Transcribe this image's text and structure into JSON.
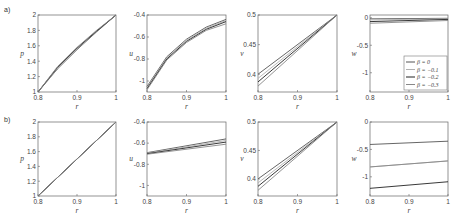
{
  "figure": {
    "row_labels": [
      "a)",
      "b)"
    ],
    "legend": {
      "entries": [
        "β = 0",
        "β = −0.1",
        "β = −0.2",
        "β = −0.3"
      ],
      "colors": [
        "#555555",
        "#b0b0b0",
        "#222222",
        "#888888"
      ],
      "position": "lower right of row a, panel w"
    }
  },
  "chart_data": [
    {
      "type": "line",
      "row": "a",
      "panel": 1,
      "xlabel": "r",
      "ylabel": "p",
      "xlim": [
        0.8,
        1
      ],
      "ylim": [
        1,
        2
      ],
      "xticks": [
        "0.8",
        "0.9",
        "1"
      ],
      "yticks": [
        "1",
        "1.2",
        "1.4",
        "1.6",
        "1.8",
        "2"
      ],
      "x": [
        0.8,
        0.85,
        0.9,
        0.95,
        1.0
      ],
      "series": [
        {
          "name": "β = 0",
          "values": [
            1.0,
            1.3,
            1.55,
            1.78,
            2.0
          ]
        },
        {
          "name": "β = −0.1",
          "values": [
            1.0,
            1.31,
            1.56,
            1.79,
            2.0
          ]
        },
        {
          "name": "β = −0.2",
          "values": [
            1.0,
            1.32,
            1.57,
            1.79,
            2.0
          ]
        },
        {
          "name": "β = −0.3",
          "values": [
            1.0,
            1.33,
            1.58,
            1.8,
            2.0
          ]
        }
      ]
    },
    {
      "type": "line",
      "row": "a",
      "panel": 2,
      "xlabel": "r",
      "ylabel": "u",
      "xlim": [
        0.8,
        1
      ],
      "ylim": [
        -1.1,
        -0.4
      ],
      "xticks": [
        "0.8",
        "0.9",
        "1"
      ],
      "yticks": [
        "-1",
        "-0.8",
        "-0.6",
        "-0.4"
      ],
      "x": [
        0.8,
        0.85,
        0.9,
        0.95,
        1.0
      ],
      "series": [
        {
          "name": "β = 0",
          "values": [
            -1.05,
            -0.78,
            -0.62,
            -0.51,
            -0.44
          ]
        },
        {
          "name": "β = −0.1",
          "values": [
            -1.06,
            -0.79,
            -0.63,
            -0.52,
            -0.45
          ]
        },
        {
          "name": "β = −0.2",
          "values": [
            -1.07,
            -0.8,
            -0.64,
            -0.53,
            -0.46
          ]
        },
        {
          "name": "β = −0.3",
          "values": [
            -1.08,
            -0.81,
            -0.65,
            -0.54,
            -0.48
          ]
        }
      ]
    },
    {
      "type": "line",
      "row": "a",
      "panel": 3,
      "xlabel": "r",
      "ylabel": "v",
      "xlim": [
        0.8,
        1
      ],
      "ylim": [
        0.37,
        0.5
      ],
      "xticks": [
        "0.8",
        "0.9",
        "1"
      ],
      "yticks": [
        "0.4",
        "0.45",
        "0.5"
      ],
      "x": [
        0.8,
        1.0
      ],
      "series": [
        {
          "name": "β = 0",
          "values": [
            0.4,
            0.5
          ]
        },
        {
          "name": "β = −0.1",
          "values": [
            0.393,
            0.5
          ]
        },
        {
          "name": "β = −0.2",
          "values": [
            0.387,
            0.5
          ]
        },
        {
          "name": "β = −0.3",
          "values": [
            0.38,
            0.5
          ]
        }
      ]
    },
    {
      "type": "line",
      "row": "a",
      "panel": 4,
      "xlabel": "r",
      "ylabel": "w",
      "xlim": [
        0.8,
        1
      ],
      "ylim": [
        -1.35,
        0.05
      ],
      "xticks": [
        "0.8",
        "0.9",
        "1"
      ],
      "yticks": [
        "-1",
        "-0.5",
        "0"
      ],
      "x": [
        0.8,
        1.0
      ],
      "series": [
        {
          "name": "β = 0",
          "values": [
            -0.02,
            -0.01
          ]
        },
        {
          "name": "β = −0.1",
          "values": [
            -0.04,
            -0.02
          ]
        },
        {
          "name": "β = −0.2",
          "values": [
            -0.07,
            -0.03
          ]
        },
        {
          "name": "β = −0.3",
          "values": [
            -0.1,
            -0.05
          ]
        }
      ],
      "legend": true
    },
    {
      "type": "line",
      "row": "b",
      "panel": 1,
      "xlabel": "r",
      "ylabel": "p",
      "xlim": [
        0.8,
        1
      ],
      "ylim": [
        1,
        2
      ],
      "xticks": [
        "0.8",
        "0.9",
        "1"
      ],
      "yticks": [
        "1",
        "1.2",
        "1.4",
        "1.6",
        "1.8",
        "2"
      ],
      "x": [
        0.8,
        1.0
      ],
      "series": [
        {
          "name": "β = 0",
          "values": [
            1.0,
            2.0
          ]
        },
        {
          "name": "β = −0.1",
          "values": [
            1.0,
            2.0
          ]
        },
        {
          "name": "β = −0.2",
          "values": [
            1.0,
            2.0
          ]
        },
        {
          "name": "β = −0.3",
          "values": [
            1.0,
            2.0
          ]
        }
      ]
    },
    {
      "type": "line",
      "row": "b",
      "panel": 2,
      "xlabel": "r",
      "ylabel": "u",
      "xlim": [
        0.8,
        1
      ],
      "ylim": [
        -1.1,
        -0.4
      ],
      "xticks": [
        "0.8",
        "0.9",
        "1"
      ],
      "yticks": [
        "-1",
        "-0.8",
        "-0.6",
        "-0.4"
      ],
      "x": [
        0.8,
        1.0
      ],
      "series": [
        {
          "name": "β = 0",
          "values": [
            -0.69,
            -0.56
          ]
        },
        {
          "name": "β = −0.1",
          "values": [
            -0.695,
            -0.575
          ]
        },
        {
          "name": "β = −0.2",
          "values": [
            -0.7,
            -0.59
          ]
        },
        {
          "name": "β = −0.3",
          "values": [
            -0.705,
            -0.61
          ]
        }
      ]
    },
    {
      "type": "line",
      "row": "b",
      "panel": 3,
      "xlabel": "r",
      "ylabel": "v",
      "xlim": [
        0.8,
        1
      ],
      "ylim": [
        0.37,
        0.5
      ],
      "xticks": [
        "0.8",
        "0.9",
        "1"
      ],
      "yticks": [
        "0.4",
        "0.45",
        "0.5"
      ],
      "x": [
        0.8,
        1.0
      ],
      "series": [
        {
          "name": "β = 0",
          "values": [
            0.4,
            0.5
          ]
        },
        {
          "name": "β = −0.1",
          "values": [
            0.393,
            0.5
          ]
        },
        {
          "name": "β = −0.2",
          "values": [
            0.387,
            0.5
          ]
        },
        {
          "name": "β = −0.3",
          "values": [
            0.38,
            0.5
          ]
        }
      ]
    },
    {
      "type": "line",
      "row": "b",
      "panel": 4,
      "xlabel": "r",
      "ylabel": "w",
      "xlim": [
        0.8,
        1
      ],
      "ylim": [
        -1.35,
        0
      ],
      "xticks": [
        "0.8",
        "0.9",
        "1"
      ],
      "yticks": [
        "-1",
        "-0.5",
        "0"
      ],
      "x": [
        0.8,
        1.0
      ],
      "series": [
        {
          "name": "β = 0",
          "values": [
            -0.41,
            -0.35
          ]
        },
        {
          "name": "β = −0.1",
          "values": [
            -0.82,
            -0.71
          ]
        },
        {
          "name": "β = −0.2",
          "values": [
            -1.21,
            -1.09
          ]
        },
        {
          "name": "β = −0.3",
          "values": [
            -0.82,
            -0.71
          ]
        }
      ]
    }
  ]
}
